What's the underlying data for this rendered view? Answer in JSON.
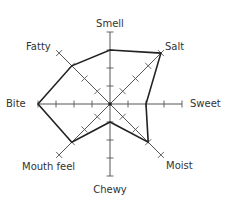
{
  "chart_data": {
    "type": "radar",
    "title": "",
    "axes": [
      "Smell",
      "Salt",
      "Sweet",
      "Moist",
      "Chewy",
      "Mouth feel",
      "Bite",
      "Fatty"
    ],
    "series": [
      {
        "name": "Profile",
        "values": [
          3,
          4,
          2,
          3,
          1,
          3,
          4,
          3
        ]
      }
    ],
    "scale": {
      "min": 0,
      "max": 4,
      "ticks": [
        1,
        2,
        3,
        4
      ]
    },
    "grid": false,
    "legend": "none",
    "colors": {
      "line": "#222222",
      "axis": "#555555",
      "label": "#333333"
    }
  },
  "labels": {
    "smell": "Smell",
    "salt": "Salt",
    "sweet": "Sweet",
    "moist": "Moist",
    "chewy": "Chewy",
    "mouth_feel": "Mouth feel",
    "bite": "Bite",
    "fatty": "Fatty"
  }
}
